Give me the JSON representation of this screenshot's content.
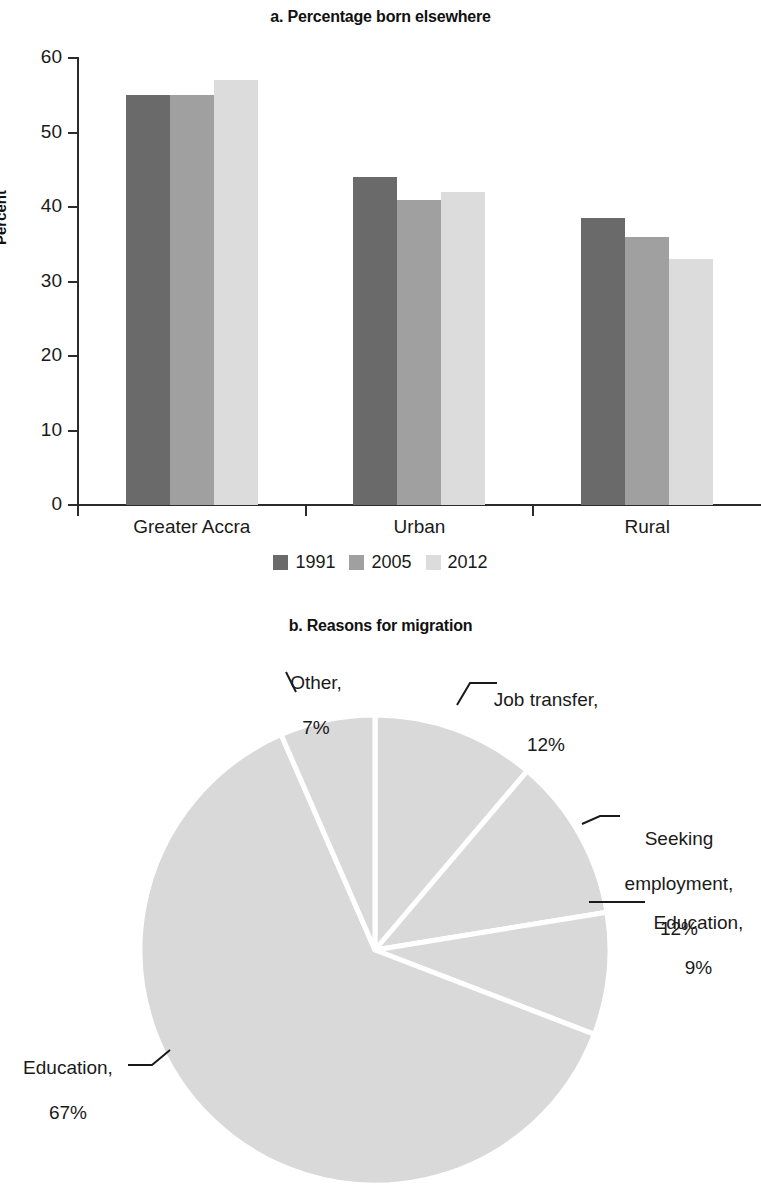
{
  "figure": {
    "panel_a_title": "a. Percentage born elsewhere",
    "panel_b_title": "b. Reasons for migration"
  },
  "colors": {
    "series_1991": "#6a6a6a",
    "series_2005": "#a0a0a0",
    "series_2012": "#dcdcdc",
    "pie_fill": "#d9d9d9",
    "axis": "#2b2b2b",
    "text": "#1a1a1a",
    "divider": "#ffffff"
  },
  "chart_data": [
    {
      "type": "bar",
      "title": "a. Percentage born elsewhere",
      "xlabel": "",
      "ylabel": "Percent",
      "ylim": [
        0,
        60
      ],
      "yticks": [
        0,
        10,
        20,
        30,
        40,
        50,
        60
      ],
      "ytick_labels": [
        "0",
        "10",
        "20",
        "30",
        "40",
        "50",
        "60"
      ],
      "grid": false,
      "legend_position": "bottom",
      "categories": [
        "Greater Accra",
        "Urban",
        "Rural"
      ],
      "series": [
        {
          "name": "1991",
          "color": "#6a6a6a",
          "values": [
            55,
            44,
            38.5
          ]
        },
        {
          "name": "2005",
          "color": "#a0a0a0",
          "values": [
            55,
            41,
            36
          ]
        },
        {
          "name": "2012",
          "color": "#dcdcdc",
          "values": [
            57,
            42,
            33
          ]
        }
      ]
    },
    {
      "type": "pie",
      "title": "b. Reasons for migration",
      "legend_position": "labels-with-leader-lines",
      "start_angle_deg": 0,
      "direction": "clockwise",
      "fill": "#d9d9d9",
      "labels": [
        "Job transfer",
        "Seeking employment",
        "Education",
        "Education",
        "Other"
      ],
      "values": [
        12,
        12,
        9,
        67,
        7
      ],
      "slices": [
        {
          "label": "Job transfer",
          "value": 12,
          "value_text": "12%",
          "label_text": "Job transfer,\n12%"
        },
        {
          "label": "Seeking employment",
          "value": 12,
          "value_text": "12%",
          "label_text": "Seeking\nemployment,\n12%"
        },
        {
          "label": "Education",
          "value": 9,
          "value_text": "9%",
          "label_text": "Education,\n9%"
        },
        {
          "label": "Education",
          "value": 67,
          "value_text": "67%",
          "label_text": "Education,\n67%"
        },
        {
          "label": "Other",
          "value": 7,
          "value_text": "7%",
          "label_text": "Other,\n7%"
        }
      ]
    }
  ],
  "panel_a": {
    "title": "a. Percentage born elsewhere",
    "y_axis_title": "Percent",
    "y_ticks": [
      {
        "label": "60"
      },
      {
        "label": "50"
      },
      {
        "label": "40"
      },
      {
        "label": "30"
      },
      {
        "label": "20"
      },
      {
        "label": "10"
      },
      {
        "label": "0"
      }
    ],
    "categories": [
      {
        "label": "Greater Accra"
      },
      {
        "label": "Urban"
      },
      {
        "label": "Rural"
      }
    ],
    "legend": [
      {
        "label": "1991"
      },
      {
        "label": "2005"
      },
      {
        "label": "2012"
      }
    ]
  },
  "panel_b": {
    "title": "b. Reasons for migration",
    "labels": [
      {
        "line1": "Other,",
        "line2": "7%"
      },
      {
        "line1": "Job transfer,",
        "line2": "12%"
      },
      {
        "line1": "Seeking",
        "line2": "employment,",
        "line3": "12%"
      },
      {
        "line1": "Education,",
        "line2": "9%"
      },
      {
        "line1": "Education,",
        "line2": "67%"
      }
    ]
  }
}
